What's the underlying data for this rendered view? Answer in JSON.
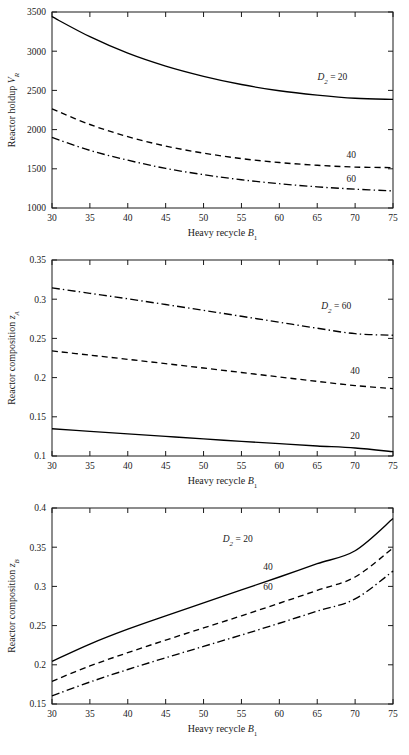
{
  "figure": {
    "panel_count": 3,
    "shared_xlabel": "Heavy recycle B1",
    "shared_xlabel_main": "Heavy recycle ",
    "shared_xlabel_italic": "B",
    "shared_xlabel_sub": "1",
    "xticks": [
      30,
      35,
      40,
      45,
      50,
      55,
      60,
      65,
      70,
      75
    ],
    "xlim": [
      30,
      75
    ],
    "line_color": "#000000",
    "axis_color": "#1a1a1a",
    "background": "#ffffff"
  },
  "chart_data": [
    {
      "type": "line",
      "title": "",
      "xlabel": "Heavy recycle B1",
      "ylabel": "Reactor holdup VR",
      "ylabel_main": "Reactor holdup ",
      "ylabel_italic": "V",
      "ylabel_sub": "R",
      "x": [
        30,
        35,
        40,
        45,
        50,
        55,
        60,
        65,
        70,
        75
      ],
      "xlim": [
        30,
        75
      ],
      "ylim": [
        1000,
        3500
      ],
      "yticks": [
        1000,
        1500,
        2000,
        2500,
        3000,
        3500
      ],
      "ytick_labels": [
        "1000",
        "1500",
        "2000",
        "2500",
        "3000",
        "3500"
      ],
      "grid": false,
      "legend": "inline-curve-labels",
      "series": [
        {
          "name": "D2 = 20",
          "label_prefix": "D",
          "label_sub": "2",
          "label_suffix": " = 20",
          "style": "solid",
          "label_x": 67.0,
          "label_y": 2630,
          "values": [
            3440,
            3185,
            2975,
            2810,
            2680,
            2575,
            2495,
            2440,
            2400,
            2385
          ]
        },
        {
          "name": "40",
          "label_prefix": "",
          "label_sub": "",
          "label_suffix": "40",
          "style": "dashed",
          "label_x": 69.5,
          "label_y": 1640,
          "values": [
            2265,
            2065,
            1910,
            1790,
            1700,
            1630,
            1580,
            1545,
            1522,
            1515
          ]
        },
        {
          "name": "60",
          "label_prefix": "",
          "label_sub": "",
          "label_suffix": "60",
          "style": "dashdot",
          "label_x": 69.5,
          "label_y": 1330,
          "values": [
            1900,
            1735,
            1610,
            1505,
            1425,
            1360,
            1310,
            1270,
            1240,
            1218
          ]
        }
      ]
    },
    {
      "type": "line",
      "title": "",
      "xlabel": "Heavy recycle B1",
      "ylabel": "Reactor composition zA",
      "ylabel_main": "Reactor composition ",
      "ylabel_italic": "z",
      "ylabel_sub": "A",
      "x": [
        30,
        35,
        40,
        45,
        50,
        55,
        60,
        65,
        70,
        75
      ],
      "xlim": [
        30,
        75
      ],
      "ylim": [
        0.1,
        0.35
      ],
      "yticks": [
        0.1,
        0.15,
        0.2,
        0.25,
        0.3,
        0.35
      ],
      "ytick_labels": [
        "0.1",
        "0.15",
        "0.2",
        "0.25",
        "0.3",
        "0.35"
      ],
      "grid": false,
      "legend": "inline-curve-labels",
      "series": [
        {
          "name": "D2 = 60",
          "label_prefix": "D",
          "label_sub": "2",
          "label_suffix": " = 60",
          "style": "dashdot",
          "label_x": 67.5,
          "label_y": 0.287,
          "values": [
            0.3145,
            0.3075,
            0.3005,
            0.2932,
            0.2858,
            0.2782,
            0.2706,
            0.263,
            0.256,
            0.254
          ]
        },
        {
          "name": "40",
          "label_prefix": "",
          "label_sub": "",
          "label_suffix": "40",
          "style": "dashed",
          "label_x": 70.0,
          "label_y": 0.2045,
          "values": [
            0.234,
            0.2287,
            0.2233,
            0.2178,
            0.2122,
            0.2065,
            0.2008,
            0.1952,
            0.1898,
            0.186
          ]
        },
        {
          "name": "20",
          "label_prefix": "",
          "label_sub": "",
          "label_suffix": "20",
          "style": "solid",
          "label_x": 70.0,
          "label_y": 0.1215,
          "values": [
            0.1348,
            0.1315,
            0.1282,
            0.125,
            0.1218,
            0.1187,
            0.1157,
            0.1128,
            0.1102,
            0.1055
          ]
        }
      ]
    },
    {
      "type": "line",
      "title": "",
      "xlabel": "Heavy recycle B1",
      "ylabel": "Reactor composition zB",
      "ylabel_main": "Reactor composition ",
      "ylabel_italic": "z",
      "ylabel_sub": "B",
      "x": [
        30,
        35,
        40,
        45,
        50,
        55,
        60,
        65,
        70,
        75
      ],
      "xlim": [
        30,
        75
      ],
      "ylim": [
        0.15,
        0.4
      ],
      "yticks": [
        0.15,
        0.2,
        0.25,
        0.3,
        0.35,
        0.4
      ],
      "ytick_labels": [
        "0.15",
        "0.2",
        "0.25",
        "0.3",
        "0.35",
        "0.4"
      ],
      "grid": false,
      "legend": "inline-curve-labels",
      "series": [
        {
          "name": "D2 = 20",
          "label_prefix": "D",
          "label_sub": "2",
          "label_suffix": " = 20",
          "style": "solid",
          "label_x": 54.5,
          "label_y": 0.3565,
          "values": [
            0.2045,
            0.2265,
            0.2455,
            0.2625,
            0.279,
            0.2955,
            0.312,
            0.329,
            0.3455,
            0.3865
          ]
        },
        {
          "name": "40",
          "label_prefix": "",
          "label_sub": "",
          "label_suffix": "40",
          "style": "dashed",
          "label_x": 58.5,
          "label_y": 0.3215,
          "values": [
            0.179,
            0.1985,
            0.2155,
            0.2315,
            0.247,
            0.2625,
            0.2785,
            0.295,
            0.312,
            0.349
          ]
        },
        {
          "name": "60",
          "label_prefix": "",
          "label_sub": "",
          "label_suffix": "60",
          "style": "dashdot",
          "label_x": 58.5,
          "label_y": 0.296,
          "values": [
            0.1605,
            0.178,
            0.194,
            0.209,
            0.2235,
            0.238,
            0.253,
            0.2685,
            0.284,
            0.3195
          ]
        }
      ]
    }
  ]
}
